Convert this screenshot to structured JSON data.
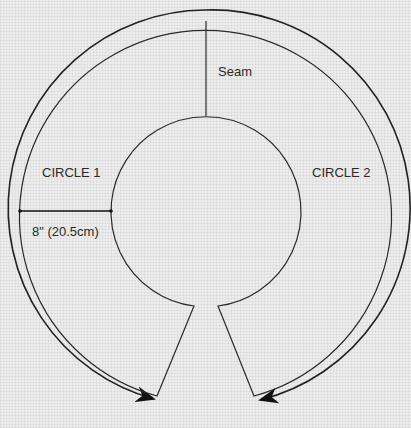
{
  "diagram": {
    "labels": {
      "seam": "Seam",
      "circle1": "CIRCLE 1",
      "circle2": "CIRCLE 2",
      "dimension": "8\" (20.5cm)"
    },
    "colors": {
      "line": "#2a2a2a",
      "background": "#ededed"
    },
    "geometry": {
      "outer_ring_radius_px": 198,
      "inner_ring_radius_px": 186,
      "center_circle_radius_px": 95,
      "dimension_line": {
        "from_x": 19,
        "to_x": 111,
        "y": 211
      }
    }
  }
}
